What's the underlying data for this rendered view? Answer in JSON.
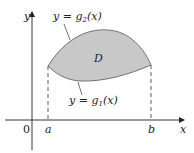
{
  "diagram": {
    "axes": {
      "x_label": "x",
      "y_label": "y",
      "origin_label": "0"
    },
    "points": {
      "a_label": "a",
      "b_label": "b"
    },
    "region": {
      "label": "D",
      "fill_color": "#c8c8c8",
      "stroke_color": "#555555"
    },
    "curves": {
      "upper": {
        "prefix": "y = g",
        "subscript": "2",
        "suffix": "(x)"
      },
      "lower": {
        "prefix": "y = g",
        "subscript": "1",
        "suffix": "(x)"
      }
    },
    "colors": {
      "axis": "#222222",
      "text": "#222222",
      "dashes": "#333333"
    }
  }
}
